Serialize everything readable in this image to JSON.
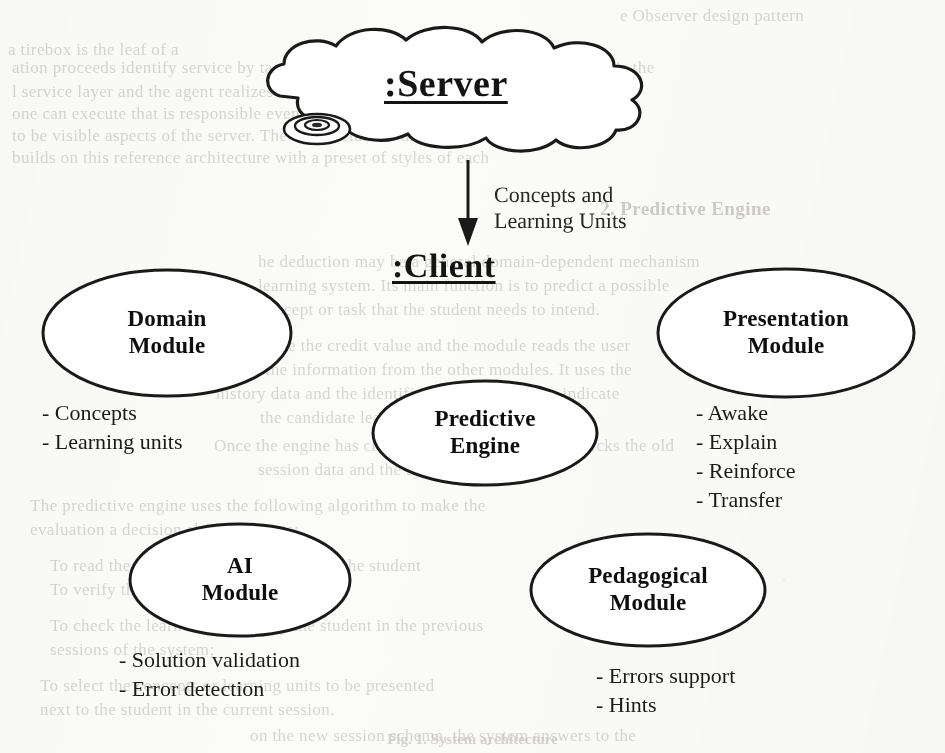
{
  "page": {
    "width": 945,
    "height": 753,
    "background_color": "#fbfbf9",
    "ink_color": "#141414"
  },
  "diagram": {
    "type": "architecture-diagram",
    "server": {
      "label": ":Server",
      "shape": "cloud",
      "icon": "disk-icon",
      "x": 460,
      "y": 92
    },
    "flow_arrow": {
      "label": "Concepts and\nLearning Units",
      "direction": "down",
      "from": ":Server",
      "to": ":Client"
    },
    "client": {
      "label": ":Client",
      "x": 460,
      "y": 268
    },
    "modules": [
      {
        "id": "domain-module",
        "label": "Domain\nModule",
        "shape": "ellipse",
        "cx": 167,
        "cy": 333,
        "rx": 124,
        "ry": 63,
        "items": [
          "- Concepts",
          "- Learning units"
        ],
        "items_x": 42,
        "items_y": 398
      },
      {
        "id": "presentation-module",
        "label": "Presentation\nModule",
        "shape": "ellipse",
        "cx": 786,
        "cy": 333,
        "rx": 128,
        "ry": 64,
        "items": [
          "- Awake",
          "- Explain",
          "- Reinforce",
          "- Transfer"
        ],
        "items_x": 696,
        "items_y": 398
      },
      {
        "id": "predictive-engine",
        "label": "Predictive\nEngine",
        "shape": "ellipse",
        "cx": 485,
        "cy": 433,
        "rx": 112,
        "ry": 52,
        "items": [],
        "items_x": 0,
        "items_y": 0
      },
      {
        "id": "ai-module",
        "label": "AI\nModule",
        "shape": "ellipse",
        "cx": 240,
        "cy": 580,
        "rx": 110,
        "ry": 56,
        "items": [
          "- Solution validation",
          "- Error detection"
        ],
        "items_x": 119,
        "items_y": 645
      },
      {
        "id": "pedagogical-module",
        "label": "Pedagogical\nModule",
        "shape": "ellipse",
        "cx": 648,
        "cy": 590,
        "rx": 117,
        "ry": 56,
        "items": [
          "- Errors support",
          "- Hints"
        ],
        "items_x": 596,
        "items_y": 661
      }
    ]
  },
  "caption": {
    "text": "Fig. 1. System architecture"
  },
  "background_bleed": {
    "description": "faint show-through text from the reverse side of the scanned page",
    "lines": [
      {
        "text": "e Observer design pattern",
        "x": 620,
        "y": 6,
        "size": 17
      },
      {
        "text": "a tirebox is the leaf of a",
        "x": 8,
        "y": 40,
        "size": 17
      },
      {
        "text": "when responds to ano",
        "x": 400,
        "y": 40,
        "size": 17
      },
      {
        "text": "ation proceeds identify service by tags.",
        "x": 12,
        "y": 58,
        "size": 17
      },
      {
        "text": "It is the",
        "x": 600,
        "y": 58,
        "size": 17
      },
      {
        "text": "l service layer and the agent realizes the broadcast",
        "x": 12,
        "y": 82,
        "size": 17
      },
      {
        "text": "one can execute that is responsible events which the tool entities",
        "x": 12,
        "y": 104,
        "size": 17
      },
      {
        "text": "to be visible aspects of the server. The architecture in the CIS",
        "x": 12,
        "y": 126,
        "size": 17
      },
      {
        "text": "builds on this reference architecture with a preset of styles of each",
        "x": 12,
        "y": 148,
        "size": 17
      },
      {
        "text": "2. Predictive Engine",
        "x": 600,
        "y": 198,
        "size": 19,
        "bold": true
      },
      {
        "text": "he deduction may be a general domain-dependent mechanism",
        "x": 258,
        "y": 252,
        "size": 17
      },
      {
        "text": "learning system. Its main function is to predict a possible",
        "x": 258,
        "y": 276,
        "size": 17
      },
      {
        "text": "concept or task that the student needs to intend.",
        "x": 258,
        "y": 300,
        "size": 17
      },
      {
        "text": "The engine the credit value and the module reads the user",
        "x": 216,
        "y": 336,
        "size": 17
      },
      {
        "text": "gather the information from the other modules. It uses the",
        "x": 216,
        "y": 360,
        "size": 17
      },
      {
        "text": "history data and the identification of the user to indicate",
        "x": 216,
        "y": 384,
        "size": 17
      },
      {
        "text": "the candidate learning units.",
        "x": 260,
        "y": 408,
        "size": 17
      },
      {
        "text": "Once the engine has chosen a subject, the system checks the old",
        "x": 214,
        "y": 436,
        "size": 17
      },
      {
        "text": "session data and the system.",
        "x": 258,
        "y": 460,
        "size": 17
      },
      {
        "text": "The predictive engine uses the following algorithm to make the",
        "x": 30,
        "y": 496,
        "size": 17
      },
      {
        "text": "evaluation a decision about concepts:",
        "x": 30,
        "y": 520,
        "size": 17
      },
      {
        "text": "To read the user data from the profile of the student",
        "x": 50,
        "y": 556,
        "size": 17
      },
      {
        "text": "To verify the state of the student;",
        "x": 50,
        "y": 580,
        "size": 17
      },
      {
        "text": "To check the learned concepts by the student in the previous",
        "x": 50,
        "y": 616,
        "size": 17
      },
      {
        "text": "sessions of the system;",
        "x": 50,
        "y": 640,
        "size": 17
      },
      {
        "text": "To select the concepts or learning units to be presented",
        "x": 40,
        "y": 676,
        "size": 17
      },
      {
        "text": "next to the student in the current session.",
        "x": 40,
        "y": 700,
        "size": 17
      },
      {
        "text": "on the new session scheme, the system answers to the",
        "x": 250,
        "y": 726,
        "size": 17
      }
    ]
  }
}
